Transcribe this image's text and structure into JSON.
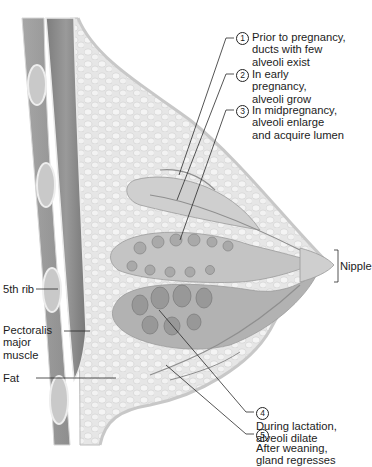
{
  "figure": {
    "stages": [
      {
        "number": "1",
        "lines": [
          "Prior to pregnancy,",
          "ducts with few",
          "alveoli exist"
        ]
      },
      {
        "number": "2",
        "lines": [
          "In early",
          "pregnancy,",
          "alveoli grow"
        ]
      },
      {
        "number": "3",
        "lines": [
          "In midpregnancy,",
          "alveoli enlarge",
          "and acquire lumen"
        ]
      },
      {
        "number": "4",
        "lines": [
          "During lactation,",
          "alveoli dilate"
        ]
      },
      {
        "number": "5",
        "lines": [
          "After weaning,",
          "gland regresses"
        ]
      }
    ],
    "anatomy_labels": {
      "nipple": "Nipple",
      "rib": "5th rib",
      "muscle": [
        "Pectoralis",
        "major",
        "muscle"
      ],
      "fat": "Fat"
    },
    "colors": {
      "background": "#ffffff",
      "tissue": "#e4e4e4",
      "muscle": "#8c8c8c",
      "gland": "#b9b9b9",
      "line": "#2a2a2a"
    }
  }
}
